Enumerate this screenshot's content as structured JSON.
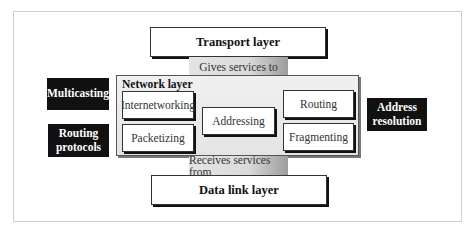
{
  "diagram": {
    "upper_layer": {
      "label": "Transport layer"
    },
    "upper_relation": {
      "label": "Gives services to"
    },
    "network_layer": {
      "title": "Network layer",
      "functions": [
        {
          "label": "Internetworking"
        },
        {
          "label": "Packetizing"
        },
        {
          "label": "Addressing"
        },
        {
          "label": "Routing"
        },
        {
          "label": "Fragmenting"
        }
      ]
    },
    "lower_relation": {
      "label": "Receives services from"
    },
    "lower_layer": {
      "label": "Data link layer"
    },
    "related_protocols": {
      "left": [
        {
          "label": "Multicasting"
        },
        {
          "label": "Routing protocols"
        }
      ],
      "right": [
        {
          "label": "Address resolution"
        }
      ]
    },
    "colors": {
      "black_box": "#111111",
      "network_fill": "#e8e8e8",
      "connector_dark": "#9c9c9c"
    }
  }
}
